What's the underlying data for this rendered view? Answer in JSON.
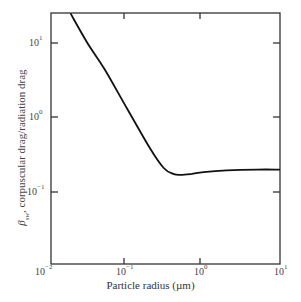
{
  "chart_data": {
    "type": "line",
    "title": "",
    "xlabel": "Particle radius (µm)",
    "ylabel": "β_sw, corpuscular drag/radiation drag",
    "xscale": "log",
    "yscale": "log",
    "xlim": [
      0.01,
      10
    ],
    "ylim": [
      0.01,
      25
    ],
    "x_ticks": [
      "10^-2",
      "10^-1",
      "10^0",
      "10^1"
    ],
    "y_ticks": [
      "10^-2",
      "10^-1",
      "10^0",
      "10^1"
    ],
    "grid": false,
    "legend": null,
    "series": [
      {
        "name": "β_sw",
        "x": [
          0.018,
          0.03,
          0.05,
          0.1,
          0.2,
          0.3,
          0.4,
          0.5,
          0.7,
          1.0,
          2.0,
          5.0,
          10.0
        ],
        "y": [
          25,
          10,
          4.5,
          1.3,
          0.38,
          0.21,
          0.175,
          0.17,
          0.175,
          0.185,
          0.195,
          0.2,
          0.2
        ]
      }
    ]
  },
  "axes": {
    "xlabel": "Particle radius (µm)",
    "ylabel_symbol": "β",
    "ylabel_sub": "sw",
    "ylabel_text": ", corpuscular drag/radiation drag",
    "x_ticks": [
      {
        "base": "10",
        "exp": "−2"
      },
      {
        "base": "10",
        "exp": "−1"
      },
      {
        "base": "10",
        "exp": "0"
      },
      {
        "base": "10",
        "exp": "1"
      }
    ],
    "y_ticks": [
      {
        "base": "10",
        "exp": "1"
      },
      {
        "base": "10",
        "exp": "0"
      },
      {
        "base": "10",
        "exp": "−1"
      }
    ]
  }
}
